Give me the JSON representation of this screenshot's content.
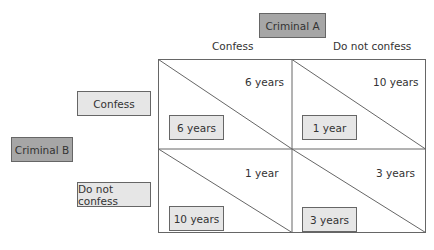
{
  "players": {
    "column": "Criminal A",
    "row": "Criminal B"
  },
  "column_strategies": [
    "Confess",
    "Do not confess"
  ],
  "row_strategies": [
    "Confess",
    "Do not confess"
  ],
  "cells": [
    {
      "row": "Confess",
      "col": "Confess",
      "a_payoff": "6 years",
      "b_payoff": "6 years"
    },
    {
      "row": "Confess",
      "col": "Do not confess",
      "a_payoff": "10 years",
      "b_payoff": "1 year"
    },
    {
      "row": "Do not confess",
      "col": "Confess",
      "a_payoff": "1 year",
      "b_payoff": "10 years"
    },
    {
      "row": "Do not confess",
      "col": "Do not confess",
      "a_payoff": "3 years",
      "b_payoff": "3 years"
    }
  ],
  "colors": {
    "player_box": "#a6a6a6",
    "strategy_box": "#e6e6e6",
    "line": "#666666"
  }
}
